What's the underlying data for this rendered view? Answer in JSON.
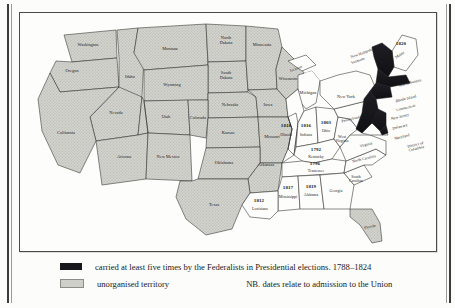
{
  "figure": {
    "kind": "historical-map"
  },
  "legend": {
    "rows": [
      {
        "swatch": "dark-solid",
        "color": "#17171c",
        "text": "carried at least five times by the Federalists in Presidential elections. 1788–1824"
      },
      {
        "swatch": "stipple",
        "color": "#cfcfca",
        "text": "unorganised territory"
      }
    ],
    "note": "NB.  dates relate to admission to the Union"
  },
  "map": {
    "colors": {
      "federalist_fill": "#17171c",
      "unorganised_fill": "#cfcfca",
      "state_fill": "#fdfdfb",
      "outline": "#2b2b2b"
    },
    "states": [
      {
        "name": "Washington",
        "x": 68,
        "y": 32,
        "fill": "unorganised"
      },
      {
        "name": "Oregon",
        "x": 52,
        "y": 58,
        "fill": "unorganised"
      },
      {
        "name": "Idaho",
        "x": 98,
        "y": 62,
        "fill": "unorganised"
      },
      {
        "name": "Montana",
        "x": 146,
        "y": 38,
        "fill": "unorganised"
      },
      {
        "name": "North\nDakota",
        "x": 203,
        "y": 38,
        "fill": "unorganised"
      },
      {
        "name": "South\nDakota",
        "x": 203,
        "y": 62,
        "fill": "unorganised"
      },
      {
        "name": "Minnesota",
        "x": 240,
        "y": 44,
        "fill": "unorganised"
      },
      {
        "name": "Wisconsin",
        "x": 263,
        "y": 70,
        "fill": "unorganised"
      },
      {
        "name": "Wyoming",
        "x": 143,
        "y": 73,
        "fill": "unorganised"
      },
      {
        "name": "Nevada",
        "x": 62,
        "y": 90,
        "fill": "unorganised"
      },
      {
        "name": "Utah",
        "x": 103,
        "y": 104,
        "fill": "unorganised"
      },
      {
        "name": "Colorado",
        "x": 152,
        "y": 106,
        "fill": "unorganised"
      },
      {
        "name": "Nebraska",
        "x": 205,
        "y": 92,
        "fill": "unorganised"
      },
      {
        "name": "Iowa",
        "x": 246,
        "y": 94,
        "fill": "unorganised"
      },
      {
        "name": "California",
        "x": 38,
        "y": 122,
        "fill": "unorganised"
      },
      {
        "name": "Arizona",
        "x": 96,
        "y": 145,
        "fill": "unorganised"
      },
      {
        "name": "New Mexico",
        "x": 145,
        "y": 145,
        "fill": "unorganised"
      },
      {
        "name": "Kansas",
        "x": 200,
        "y": 123,
        "fill": "unorganised"
      },
      {
        "name": "Missouri",
        "x": 243,
        "y": 126,
        "fill": "unorganised"
      },
      {
        "name": "Oklahoma",
        "x": 196,
        "y": 152,
        "fill": "unorganised"
      },
      {
        "name": "Arkansas",
        "x": 238,
        "y": 153,
        "fill": "unorganised"
      },
      {
        "name": "Texas",
        "x": 190,
        "y": 190,
        "fill": "unorganised"
      },
      {
        "name": "Michigan",
        "x": 288,
        "y": 82,
        "fill": "state"
      },
      {
        "name": "Illinois",
        "x": 262,
        "y": 118,
        "fill": "state"
      },
      {
        "name": "Indiana",
        "x": 281,
        "y": 118,
        "fill": "state"
      },
      {
        "name": "Ohio",
        "x": 301,
        "y": 117,
        "fill": "state"
      },
      {
        "name": "Kentucky",
        "x": 300,
        "y": 141,
        "fill": "state"
      },
      {
        "name": "Tennessee",
        "x": 300,
        "y": 158,
        "fill": "state"
      },
      {
        "name": "Mississippi",
        "x": 264,
        "y": 183,
        "fill": "state"
      },
      {
        "name": "Alabama",
        "x": 290,
        "y": 183,
        "fill": "state"
      },
      {
        "name": "Louisiana",
        "x": 232,
        "y": 196,
        "fill": "state"
      },
      {
        "name": "Georgia",
        "x": 320,
        "y": 181,
        "fill": "state"
      },
      {
        "name": "Florida",
        "x": 349,
        "y": 212,
        "fill": "unorganised"
      },
      {
        "name": "South\nCarolina",
        "x": 330,
        "y": 163,
        "fill": "state"
      },
      {
        "name": "North Carolina",
        "x": 334,
        "y": 148,
        "fill": "state"
      },
      {
        "name": "Virginia",
        "x": 334,
        "y": 131,
        "fill": "state"
      },
      {
        "name": "West\nVirginia",
        "x": 313,
        "y": 129,
        "fill": "state"
      },
      {
        "name": "Pennsylvania",
        "x": 334,
        "y": 106,
        "fill": "state"
      },
      {
        "name": "New York",
        "x": 333,
        "y": 83,
        "fill": "state"
      },
      {
        "name": "Maryland",
        "x": 373,
        "y": 124,
        "fill": "state"
      },
      {
        "name": "District of Columbia",
        "x": 392,
        "y": 131,
        "fill": "state"
      },
      {
        "name": "Delaware",
        "x": 371,
        "y": 115,
        "fill": "federalist"
      },
      {
        "name": "New Jersey",
        "x": 372,
        "y": 106,
        "fill": "federalist"
      },
      {
        "name": "Connecticut",
        "x": 376,
        "y": 97,
        "fill": "federalist"
      },
      {
        "name": "Rhode Island",
        "x": 377,
        "y": 89,
        "fill": "federalist"
      },
      {
        "name": "Massachusetts",
        "x": 380,
        "y": 72,
        "fill": "federalist"
      },
      {
        "name": "Vermont",
        "x": 336,
        "y": 48,
        "fill": "federalist"
      },
      {
        "name": "New Hampshire",
        "x": 339,
        "y": 41,
        "fill": "federalist"
      },
      {
        "name": "Maine",
        "x": 379,
        "y": 47,
        "fill": "state"
      },
      {
        "name": "Jackson",
        "x": 272,
        "y": 58,
        "fill": "unorganised"
      }
    ],
    "admission_dates": [
      {
        "state": "Maine",
        "year": "1820",
        "x": 381,
        "y": 31
      },
      {
        "state": "Illinois",
        "year": "1818",
        "x": 262,
        "y": 110
      },
      {
        "state": "Indiana",
        "year": "1816",
        "x": 281,
        "y": 110
      },
      {
        "state": "Ohio",
        "year": "1803",
        "x": 301,
        "y": 108
      },
      {
        "state": "Kentucky",
        "year": "1792",
        "x": 300,
        "y": 134
      },
      {
        "state": "Tennessee",
        "year": "1796",
        "x": 299,
        "y": 151
      },
      {
        "state": "Mississippi",
        "year": "1817",
        "x": 264,
        "y": 174
      },
      {
        "state": "Alabama",
        "year": "1819",
        "x": 290,
        "y": 174
      },
      {
        "state": "Louisiana",
        "year": "1812",
        "x": 231,
        "y": 188
      }
    ]
  }
}
